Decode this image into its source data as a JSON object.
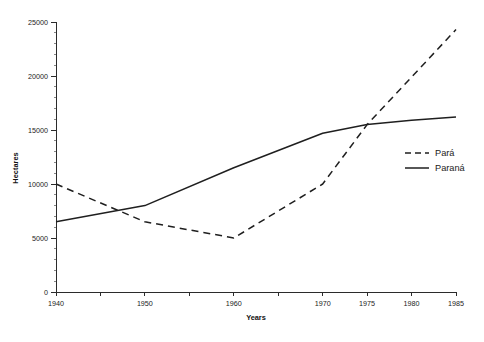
{
  "chart_data": {
    "type": "line",
    "title": "",
    "xlabel": "Years",
    "ylabel": "Hectares",
    "xlim": [
      1940,
      1985
    ],
    "ylim": [
      0,
      25000
    ],
    "grid": false,
    "legend_position": "right",
    "x_tick_labels": [
      "1940",
      "1950",
      "1960",
      "1970",
      "1975",
      "1980",
      "1985"
    ],
    "x_tick_values": [
      1940,
      1950,
      1960,
      1970,
      1975,
      1980,
      1985
    ],
    "x_minor_ticks": [
      1945,
      1955,
      1965
    ],
    "y_tick_labels": [
      "0",
      "5000",
      "10000",
      "15000",
      "20000",
      "25000"
    ],
    "y_tick_values": [
      0,
      5000,
      10000,
      15000,
      20000,
      25000
    ],
    "y_minor_step": 1000,
    "x": [
      1940,
      1950,
      1960,
      1970,
      1975,
      1980,
      1985
    ],
    "series": [
      {
        "name": "Pará",
        "style": "dashed",
        "color": "#1f1f1f",
        "values": [
          10000,
          6500,
          5000,
          10000,
          15500,
          19900,
          24300
        ]
      },
      {
        "name": "Paraná",
        "style": "solid",
        "color": "#1f1f1f",
        "values": [
          6500,
          8000,
          11500,
          14700,
          15500,
          15900,
          16200
        ]
      }
    ]
  },
  "legend": {
    "items": [
      {
        "label": "Pará",
        "style": "dashed"
      },
      {
        "label": "Paraná",
        "style": "solid"
      }
    ]
  },
  "axis_titles": {
    "x": "Years",
    "y": "Hectares"
  }
}
